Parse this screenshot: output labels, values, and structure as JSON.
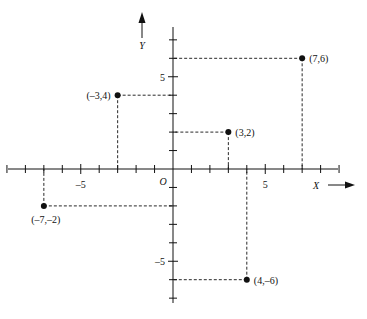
{
  "diagram": {
    "title": "",
    "x_axis_label": "X",
    "y_axis_label": "Y",
    "origin_label": "O",
    "x_tick_labels": [
      {
        "value": -5,
        "text": "–5"
      },
      {
        "value": 5,
        "text": "5"
      }
    ],
    "y_tick_labels": [
      {
        "value": 5,
        "text": "5"
      },
      {
        "value": -5,
        "text": "–5"
      }
    ],
    "x_range": [
      -9,
      9
    ],
    "y_range": [
      -7,
      7
    ],
    "points": [
      {
        "x": 7,
        "y": 6,
        "label": "(7,6)"
      },
      {
        "x": -3,
        "y": 4,
        "label": "(–3,4)"
      },
      {
        "x": 3,
        "y": 2,
        "label": "(3,2)"
      },
      {
        "x": -7,
        "y": -2,
        "label": "(–7,–2)"
      },
      {
        "x": 4,
        "y": -6,
        "label": "(4,–6)"
      }
    ],
    "colors": {
      "ink": "#111111",
      "background": "#ffffff"
    }
  }
}
